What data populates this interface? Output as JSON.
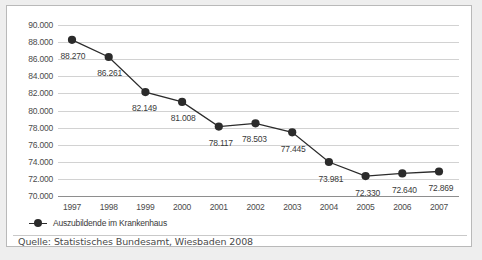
{
  "chart_data": {
    "type": "line",
    "title": "",
    "xlabel": "",
    "ylabel": "",
    "categories": [
      "1997",
      "1998",
      "1999",
      "2000",
      "2001",
      "2002",
      "2003",
      "2004",
      "2005",
      "2006",
      "2007"
    ],
    "values": [
      88270,
      86261,
      82149,
      81008,
      78117,
      78503,
      77445,
      73981,
      72330,
      72640,
      72869
    ],
    "point_labels": [
      "88.270",
      "86.261",
      "82.149",
      "81.008",
      "78.117",
      "78.503",
      "77.445",
      "73.981",
      "72.330",
      "72.640",
      "72.869"
    ],
    "ylim": [
      70000,
      90000
    ],
    "ytick_values": [
      70000,
      72000,
      74000,
      76000,
      78000,
      80000,
      82000,
      84000,
      86000,
      88000,
      90000
    ],
    "ytick_labels": [
      "70.000",
      "72.000",
      "74.000",
      "76.000",
      "78.000",
      "80.000",
      "82.000",
      "84.000",
      "86.000",
      "88.000",
      "90.000"
    ],
    "grid": true,
    "legend_position": "below-left",
    "series": [
      {
        "name": "Auszubildende im Krankenhaus",
        "values": [
          88270,
          86261,
          82149,
          81008,
          78117,
          78503,
          77445,
          73981,
          72330,
          72640,
          72869
        ]
      }
    ],
    "colors": {
      "line": "#2b2b2b",
      "marker": "#2b2b2b",
      "grid": "#d2d2d2",
      "axis": "#8e8e8e",
      "label_text": "#4b4b4b",
      "figure_background": "#ffffff",
      "page_background": "#eeeeee",
      "border": "#b9b9b9"
    }
  },
  "legend": {
    "marker_icon": "line-with-circle-marker-icon",
    "label": "Auszubildende im Krankenhaus"
  },
  "source": {
    "text": "Quelle: Statistisches Bundesamt, Wiesbaden 2008"
  }
}
